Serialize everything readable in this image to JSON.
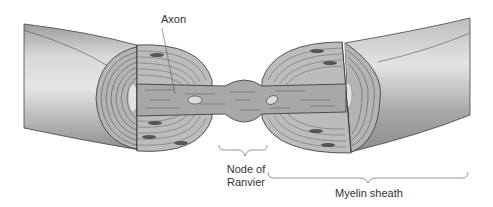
{
  "figure": {
    "labels": {
      "axon": "Axon",
      "node_line1": "Node of",
      "node_line2": "Ranvier",
      "myelin": "Myelin sheath"
    },
    "colors": {
      "background": "#ffffff",
      "sheath_outer": "#c8c8c8",
      "sheath_shadow": "#9a9a9a",
      "lamellae": "#a9a9a9",
      "axon": "#a6a6a6",
      "nucleus": "#555555",
      "outline": "#333333",
      "text": "#333333"
    }
  }
}
